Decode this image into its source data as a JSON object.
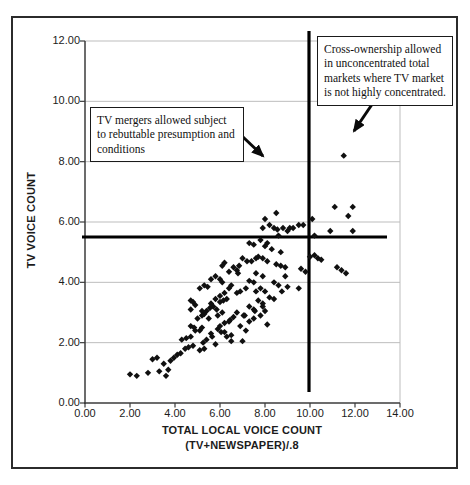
{
  "figure": {
    "background": "#ffffff",
    "border_color": "#2b2b2b"
  },
  "chart_data": {
    "type": "scatter",
    "title": "",
    "ylabel": "TV VOICE COUNT",
    "xlabel": "TOTAL LOCAL VOICE COUNT",
    "xlabel2": "(TV+NEWSPAPER)/.8",
    "xlim": [
      0,
      14
    ],
    "ylim": [
      0,
      12
    ],
    "x_tick_values": [
      0,
      2,
      4,
      6,
      8,
      10,
      12,
      14
    ],
    "x_tick_labels": [
      "0.00",
      "2.00",
      "4.00",
      "6.00",
      "8.00",
      "10.00",
      "12.00",
      "14.00"
    ],
    "y_tick_values": [
      0,
      2,
      4,
      6,
      8,
      10,
      12
    ],
    "y_tick_labels": [
      "0.00",
      "2.00",
      "4.00",
      "6.00",
      "8.00",
      "10.00",
      "12.00"
    ],
    "grid": "horizontal-only",
    "grid_color": "#bdbdbd",
    "axis_color": "#3b3b3b",
    "marker": "diamond",
    "marker_color": "#101010",
    "reference_lines": {
      "horizontal_y": 5.5,
      "vertical_x": 10.0,
      "color": "#000000"
    },
    "annotations": [
      {
        "id": "tv-mergers-note",
        "lines": [
          "TV mergers allowed subject",
          "to rebuttable presumption and",
          "conditions"
        ]
      },
      {
        "id": "cross-ownership-note",
        "lines": [
          "Cross-ownership allowed",
          "in unconcentrated total",
          "markets where TV market",
          "is not highly concentrated."
        ]
      }
    ],
    "points": [
      [
        2.0,
        0.95
      ],
      [
        2.3,
        0.9
      ],
      [
        2.8,
        1.0
      ],
      [
        3.0,
        1.45
      ],
      [
        3.2,
        1.5
      ],
      [
        3.3,
        1.05
      ],
      [
        3.5,
        1.3
      ],
      [
        3.6,
        0.9
      ],
      [
        3.7,
        1.1
      ],
      [
        3.8,
        1.4
      ],
      [
        3.95,
        1.5
      ],
      [
        4.1,
        1.6
      ],
      [
        4.25,
        1.65
      ],
      [
        4.45,
        1.8
      ],
      [
        4.3,
        2.1
      ],
      [
        4.5,
        2.15
      ],
      [
        4.6,
        1.85
      ],
      [
        4.8,
        1.9
      ],
      [
        4.7,
        2.2
      ],
      [
        4.9,
        2.4
      ],
      [
        5.1,
        2.4
      ],
      [
        5.2,
        2.5
      ],
      [
        5.1,
        1.75
      ],
      [
        5.3,
        1.8
      ],
      [
        5.25,
        2.0
      ],
      [
        5.4,
        2.1
      ],
      [
        5.8,
        1.95
      ],
      [
        4.7,
        2.55
      ],
      [
        4.85,
        2.5
      ],
      [
        5.0,
        2.8
      ],
      [
        5.2,
        2.9
      ],
      [
        5.4,
        3.05
      ],
      [
        5.55,
        3.15
      ],
      [
        5.6,
        2.3
      ],
      [
        5.65,
        2.2
      ],
      [
        5.9,
        2.45
      ],
      [
        6.0,
        2.55
      ],
      [
        6.2,
        2.65
      ],
      [
        6.4,
        2.7
      ],
      [
        6.6,
        2.85
      ],
      [
        5.9,
        2.9
      ],
      [
        6.1,
        3.0
      ],
      [
        5.5,
        2.8
      ],
      [
        5.7,
        3.2
      ],
      [
        6.0,
        3.35
      ],
      [
        6.3,
        2.2
      ],
      [
        6.5,
        2.25
      ],
      [
        6.5,
        2.05
      ],
      [
        7.0,
        2.05
      ],
      [
        6.05,
        2.35
      ],
      [
        6.2,
        2.35
      ],
      [
        6.45,
        2.75
      ],
      [
        6.75,
        3.0
      ],
      [
        6.9,
        2.55
      ],
      [
        7.15,
        2.4
      ],
      [
        7.3,
        2.7
      ],
      [
        7.5,
        2.8
      ],
      [
        7.8,
        2.9
      ],
      [
        7.1,
        2.9
      ],
      [
        8.0,
        3.05
      ],
      [
        8.1,
        2.6
      ],
      [
        4.7,
        3.4
      ],
      [
        4.8,
        3.35
      ],
      [
        4.9,
        3.25
      ],
      [
        4.7,
        3.1
      ],
      [
        5.2,
        3.05
      ],
      [
        5.3,
        2.95
      ],
      [
        5.85,
        3.1
      ],
      [
        5.6,
        3.3
      ],
      [
        5.8,
        3.45
      ],
      [
        6.0,
        3.55
      ],
      [
        6.15,
        3.4
      ],
      [
        6.3,
        3.45
      ],
      [
        6.2,
        3.65
      ],
      [
        6.4,
        3.8
      ],
      [
        6.5,
        3.9
      ],
      [
        6.75,
        3.65
      ],
      [
        6.9,
        3.7
      ],
      [
        7.05,
        2.9
      ],
      [
        5.3,
        3.9
      ],
      [
        5.45,
        3.85
      ],
      [
        5.1,
        3.8
      ],
      [
        5.6,
        4.1
      ],
      [
        5.8,
        4.2
      ],
      [
        6.0,
        4.1
      ],
      [
        6.1,
        4.0
      ],
      [
        6.2,
        4.65
      ],
      [
        6.1,
        4.55
      ],
      [
        6.4,
        4.35
      ],
      [
        6.6,
        4.5
      ],
      [
        6.75,
        4.4
      ],
      [
        6.85,
        4.55
      ],
      [
        7.0,
        4.8
      ],
      [
        7.2,
        4.7
      ],
      [
        7.15,
        3.8
      ],
      [
        6.8,
        4.3
      ],
      [
        7.3,
        3.2
      ],
      [
        7.5,
        3.1
      ],
      [
        7.7,
        3.4
      ],
      [
        7.9,
        3.3
      ],
      [
        7.6,
        3.7
      ],
      [
        7.8,
        3.8
      ],
      [
        8.0,
        3.7
      ],
      [
        7.55,
        3.05
      ],
      [
        7.9,
        3.2
      ],
      [
        8.2,
        3.5
      ],
      [
        8.4,
        3.45
      ],
      [
        8.4,
        4.0
      ],
      [
        8.6,
        3.9
      ],
      [
        8.75,
        3.7
      ],
      [
        9.0,
        3.85
      ],
      [
        9.5,
        3.8
      ],
      [
        8.9,
        4.2
      ],
      [
        7.3,
        4.05
      ],
      [
        7.5,
        4.0
      ],
      [
        7.6,
        4.3
      ],
      [
        7.9,
        4.2
      ],
      [
        7.6,
        4.8
      ],
      [
        7.7,
        4.85
      ],
      [
        7.9,
        4.8
      ],
      [
        8.1,
        4.7
      ],
      [
        7.4,
        4.7
      ],
      [
        8.5,
        4.6
      ],
      [
        8.7,
        4.55
      ],
      [
        8.9,
        4.5
      ],
      [
        9.6,
        4.45
      ],
      [
        9.8,
        4.35
      ],
      [
        7.3,
        5.3
      ],
      [
        7.5,
        5.25
      ],
      [
        7.8,
        5.4
      ],
      [
        8.0,
        5.2
      ],
      [
        8.1,
        5.3
      ],
      [
        8.3,
        5.1
      ],
      [
        8.7,
        5.0
      ],
      [
        7.9,
        5.8
      ],
      [
        8.0,
        6.1
      ],
      [
        8.2,
        5.9
      ],
      [
        8.4,
        5.8
      ],
      [
        8.5,
        6.3
      ],
      [
        8.55,
        5.75
      ],
      [
        8.8,
        5.8
      ],
      [
        9.0,
        5.7
      ],
      [
        9.1,
        5.8
      ],
      [
        9.25,
        5.8
      ],
      [
        9.5,
        5.9
      ],
      [
        9.7,
        5.9
      ],
      [
        8.6,
        5.55
      ],
      [
        10.2,
        5.55
      ],
      [
        10.1,
        6.1
      ],
      [
        10.9,
        5.7
      ],
      [
        11.9,
        5.7
      ],
      [
        11.1,
        6.5
      ],
      [
        11.9,
        6.5
      ],
      [
        11.7,
        6.2
      ],
      [
        11.5,
        8.2
      ],
      [
        10.0,
        4.85
      ],
      [
        10.2,
        4.9
      ],
      [
        10.35,
        4.8
      ],
      [
        10.5,
        4.75
      ],
      [
        11.2,
        4.5
      ],
      [
        11.4,
        4.4
      ],
      [
        11.6,
        4.3
      ]
    ]
  }
}
